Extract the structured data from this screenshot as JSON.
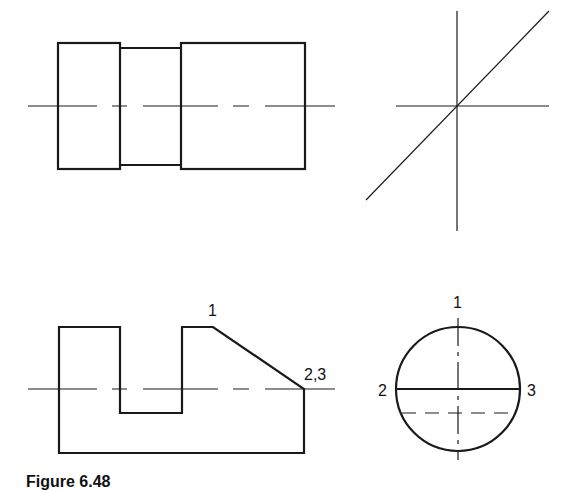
{
  "figure": {
    "caption": "Figure 6.48",
    "stroke_color": "#1a1a1a",
    "background": "#ffffff"
  },
  "views": {
    "top_view": {
      "description": "stepped cylinder top view with centerline",
      "left_block": {
        "x": 58,
        "y": 43,
        "w": 62,
        "h": 126
      },
      "neck": {
        "x": 120,
        "y": 48,
        "w": 61,
        "h": 117
      },
      "right_block": {
        "x": 181,
        "y": 43,
        "w": 124,
        "h": 126
      },
      "centerline": {
        "x1": 28,
        "x2": 335,
        "y": 106
      }
    },
    "miter": {
      "description": "projection construction lines",
      "vertical": {
        "x": 457,
        "y1": 11,
        "y2": 231
      },
      "horizontal": {
        "y": 106,
        "x1": 396,
        "x2": 549
      },
      "diagonal": {
        "x1": 366,
        "y1": 200,
        "x2": 549,
        "y2": 11
      }
    },
    "front_view": {
      "description": "slotted block with chamfered end",
      "labels": {
        "point_1": "1",
        "point_2_3": "2,3"
      },
      "centerline": {
        "x1": 28,
        "x2": 335,
        "y": 389
      }
    },
    "side_view": {
      "description": "circular end view with chord and hidden line",
      "circle": {
        "cx": 458,
        "cy": 389,
        "r": 61
      },
      "labels": {
        "top": "1",
        "left": "2",
        "right": "3"
      }
    }
  }
}
